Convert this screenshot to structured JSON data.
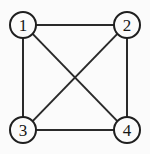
{
  "figure": {
    "background_color": "#fbfbfb",
    "width": 150,
    "height": 154,
    "edge_color": "#2a2a2a",
    "node_stroke_color": "#1f1f1f",
    "node_fill_color": "#fbfbfb",
    "label_color": "#151515"
  },
  "graph": {
    "type": "undirected",
    "node_radius": 13,
    "vertex_count": 4,
    "edge_count": 6,
    "is_complete": true,
    "nodes": [
      {
        "id": "1",
        "label": "1",
        "cx": 23,
        "cy": 25
      },
      {
        "id": "2",
        "label": "2",
        "cx": 127,
        "cy": 25
      },
      {
        "id": "3",
        "label": "3",
        "cx": 23,
        "cy": 130
      },
      {
        "id": "4",
        "label": "4",
        "cx": 127,
        "cy": 130
      }
    ],
    "edges": [
      {
        "id": "edge-1-2",
        "from": "1",
        "to": "2",
        "x1": 36,
        "y1": 25,
        "x2": 114,
        "y2": 25
      },
      {
        "id": "edge-1-3",
        "from": "1",
        "to": "3",
        "x1": 23,
        "y1": 38,
        "x2": 23,
        "y2": 117
      },
      {
        "id": "edge-2-4",
        "from": "2",
        "to": "4",
        "x1": 127,
        "y1": 38,
        "x2": 127,
        "y2": 117
      },
      {
        "id": "edge-3-4",
        "from": "3",
        "to": "4",
        "x1": 36,
        "y1": 130,
        "x2": 114,
        "y2": 130
      },
      {
        "id": "edge-1-4",
        "from": "1",
        "to": "4",
        "x1": 32.9,
        "y1": 34.1,
        "x2": 117.1,
        "y2": 120.9
      },
      {
        "id": "edge-2-3",
        "from": "2",
        "to": "3",
        "x1": 117.1,
        "y1": 34.1,
        "x2": 32.9,
        "y2": 120.9
      }
    ]
  }
}
